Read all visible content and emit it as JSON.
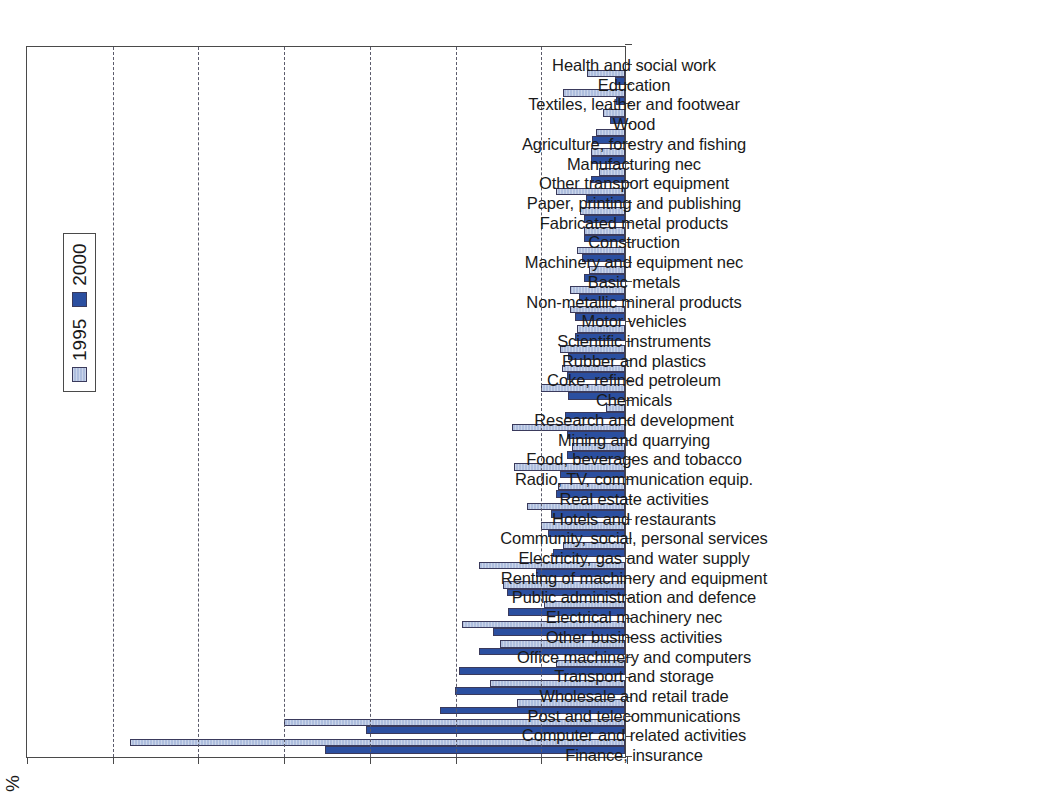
{
  "figure": {
    "axis_unit": "%",
    "value_axis_ticks": [
      0,
      5,
      10,
      15,
      20,
      25,
      30,
      35
    ],
    "legend_title": "",
    "legend_entries": [
      {
        "label": "1995",
        "color": "#AEBEDE"
      },
      {
        "label": "2000",
        "color": "#2B4FA0"
      }
    ]
  },
  "colors": {
    "series_1995": "#AEBEDE",
    "series_2000": "#2B4FA0",
    "axis": "#4A4A4A",
    "grid": "#5A5A6A",
    "background": "#FFFFFF"
  },
  "chart_data": {
    "type": "bar",
    "title": "",
    "subtitle": "",
    "xlabel": "",
    "ylabel": "",
    "unit": "%",
    "ylim": [
      0,
      35
    ],
    "yticks": [
      0,
      5,
      10,
      15,
      20,
      25,
      30,
      35
    ],
    "grid": true,
    "orientation": "vertical-rotated-90ccw",
    "legend_position": "inside-upper-center",
    "categories": [
      "Finance, insurance",
      "Computer and related activities",
      "Post and telecommunications",
      "Wholesale and retail trade",
      "Transport and storage",
      "Office machinery and computers",
      "Other business activities",
      "Electrical machinery nec",
      "Public administration and defence",
      "Renting of machinery and equipment",
      "Electricity, gas and water supply",
      "Community, social, personal services",
      "Hotels and restaurants",
      "Real estate activities",
      "Radio, TV, communication equip.",
      "Food, beverages and tobacco",
      "Mining and quarrying",
      "Research and development",
      "Chemicals",
      "Coke, refined petroleum",
      "Rubber and plastics",
      "Scientific instruments",
      "Motor vehicles",
      "Non-metallic mineral products",
      "Basic metals",
      "Machinery and equipment nec",
      "Construction",
      "Fabricated metal products",
      "Paper, printing and publishing",
      "Other transport equipment",
      "Manufacturing nec",
      "Agriculture, forestry and fishing",
      "Wood",
      "Textiles, leather and footwear",
      "Education",
      "Health and social work"
    ],
    "series": [
      {
        "name": "2000",
        "color": "#2B4FA0",
        "values": [
          17.5,
          15.1,
          10.8,
          9.9,
          9.7,
          8.5,
          7.7,
          6.8,
          6.9,
          5.2,
          4.2,
          4.5,
          4.3,
          4.0,
          3.8,
          3.4,
          3.4,
          3.5,
          3.3,
          3.4,
          3.3,
          2.9,
          2.9,
          2.7,
          2.4,
          2.5,
          2.4,
          2.4,
          2.3,
          2.0,
          2.0,
          1.9,
          0.9,
          0.5,
          0.6,
          0.0
        ]
      },
      {
        "name": "1995",
        "color": "#AEBEDE",
        "values": [
          28.9,
          19.9,
          6.3,
          7.9,
          4.0,
          7.3,
          9.5,
          4.7,
          7.1,
          8.5,
          3.6,
          4.9,
          5.7,
          3.9,
          6.5,
          3.1,
          6.6,
          1.1,
          4.9,
          3.7,
          3.8,
          2.8,
          3.2,
          3.2,
          2.1,
          2.8,
          2.4,
          2.6,
          4.0,
          1.5,
          2.0,
          1.7,
          1.3,
          3.6,
          2.2,
          0.0
        ]
      }
    ]
  }
}
